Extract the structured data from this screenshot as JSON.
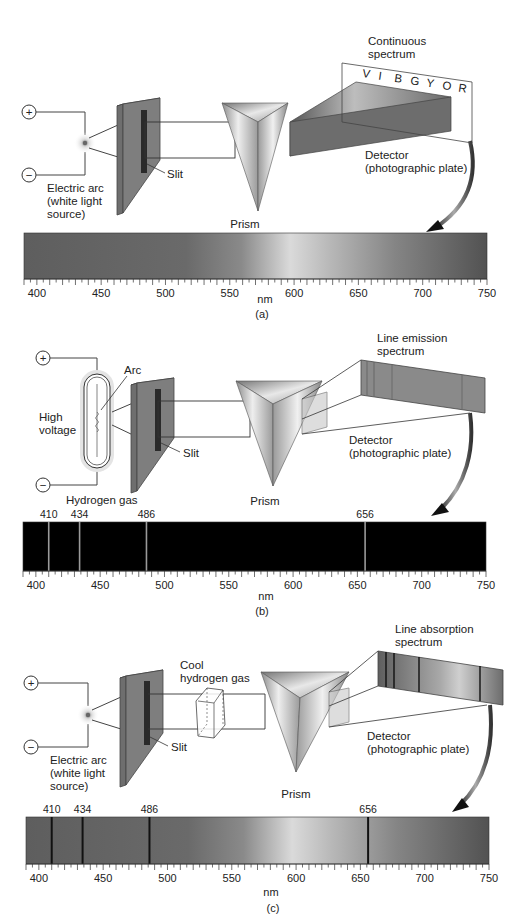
{
  "panels": [
    {
      "id": "a",
      "caption": "(a)",
      "source_label": [
        "Electric arc",
        "(white light",
        "source)"
      ],
      "slit_label": "Slit",
      "prism_label": "Prism",
      "spectrum_title": [
        "Continuous",
        "spectrum"
      ],
      "spectrum_letters": [
        "V",
        "I",
        "B",
        "G",
        "Y",
        "O",
        "R"
      ],
      "detector_label": [
        "Detector",
        "(photographic plate)"
      ],
      "plus_symbol": "+",
      "minus_symbol": "−",
      "axis_unit": "nm",
      "spectrum_type": "continuous"
    },
    {
      "id": "b",
      "caption": "(b)",
      "arc_label": "Arc",
      "voltage_label": [
        "High",
        "voltage"
      ],
      "gas_label": "Hydrogen gas",
      "slit_label": "Slit",
      "prism_label": "Prism",
      "spectrum_title": [
        "Line emission",
        "spectrum"
      ],
      "detector_label": [
        "Detector",
        "(photographic plate)"
      ],
      "plus_symbol": "+",
      "minus_symbol": "−",
      "axis_unit": "nm",
      "spectrum_type": "emission"
    },
    {
      "id": "c",
      "caption": "(c)",
      "source_label": [
        "Electric arc",
        "(white light",
        "source)"
      ],
      "gas_label": [
        "Cool",
        "hydrogen gas"
      ],
      "slit_label": "Slit",
      "prism_label": "Prism",
      "spectrum_title": [
        "Line absorption",
        "spectrum"
      ],
      "detector_label": [
        "Detector",
        "(photographic plate)"
      ],
      "plus_symbol": "+",
      "minus_symbol": "−",
      "axis_unit": "nm",
      "spectrum_type": "absorption"
    }
  ],
  "chart_data": {
    "type": "spectrum",
    "xlabel": "nm",
    "xlim": [
      390,
      750
    ],
    "major_ticks": [
      400,
      450,
      500,
      550,
      600,
      650,
      700,
      750
    ],
    "minor_tick_step": 5,
    "hydrogen_lines_nm": [
      410,
      434,
      486,
      656
    ],
    "hydrogen_line_labels": [
      "410",
      "434",
      "486",
      "656"
    ]
  },
  "colors": {
    "spectrum_dark": "#5a5a5a",
    "spectrum_light": "#d8d8d8",
    "emission_bg": "#000000",
    "emission_line": "#9a9a9a",
    "absorption_line": "#111111",
    "plate_fill": "#7d7d7d"
  }
}
